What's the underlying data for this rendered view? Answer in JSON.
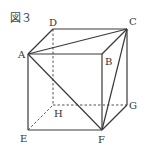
{
  "figure": {
    "title": "図３",
    "colors": {
      "line": "#3a3a3a",
      "hidden": "#555555",
      "text": "#333333"
    },
    "vertices": {
      "A": {
        "label": "A",
        "x": 28,
        "y": 54
      },
      "B": {
        "label": "B",
        "x": 102,
        "y": 54
      },
      "C": {
        "label": "C",
        "x": 127,
        "y": 29
      },
      "D": {
        "label": "D",
        "x": 53,
        "y": 29
      },
      "E": {
        "label": "E",
        "x": 28,
        "y": 130
      },
      "F": {
        "label": "F",
        "x": 102,
        "y": 130
      },
      "G": {
        "label": "G",
        "x": 127,
        "y": 105
      },
      "H": {
        "label": "H",
        "x": 53,
        "y": 105
      }
    },
    "solid_edges": [
      "AB",
      "BC",
      "CD",
      "DA",
      "AE",
      "EF",
      "BF",
      "FG",
      "CG"
    ],
    "hidden_edges": [
      "DH",
      "EH",
      "HG"
    ],
    "diagonals": [
      "AC",
      "AF",
      "CF"
    ]
  }
}
